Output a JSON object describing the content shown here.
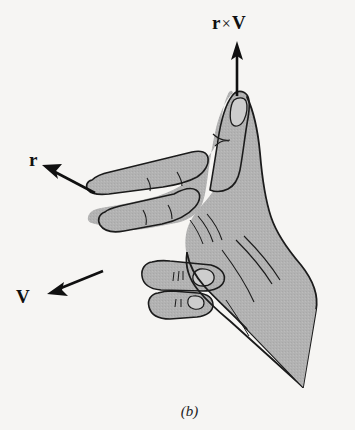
{
  "figure": {
    "caption": "(b)",
    "background_color": "#f6f5f3",
    "ink_color": "#101010",
    "hand_fill_color": "#b2b2b2",
    "nail_fill_color": "#c9c9c9"
  },
  "labels": {
    "cross_product": {
      "left_operand": "r",
      "operator": "×",
      "right_operand": "V"
    },
    "position_vector": "r",
    "velocity_vector": "V"
  },
  "arrows": [
    {
      "name": "r-cross-v-arrow",
      "direction": "up",
      "label": "r × V"
    },
    {
      "name": "r-arrow",
      "direction": "up-left",
      "label": "r"
    },
    {
      "name": "v-arrow",
      "direction": "down-left",
      "label": "V"
    }
  ]
}
